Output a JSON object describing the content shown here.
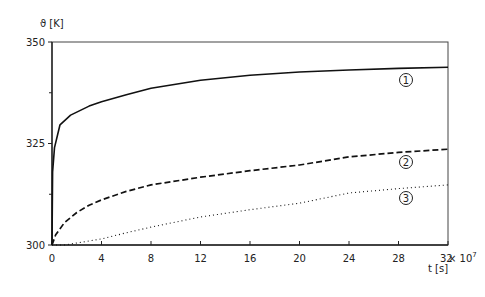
{
  "chart_data": {
    "type": "line",
    "title": "",
    "ylabel": "ϑ [K]",
    "xlabel": "t [s]",
    "x_multiplier": "× 10⁷",
    "xlim": [
      0,
      32
    ],
    "ylim": [
      300,
      350
    ],
    "x_ticks": [
      0,
      4,
      8,
      12,
      16,
      20,
      24,
      28,
      32
    ],
    "y_ticks": [
      300,
      325,
      350
    ],
    "y_minor_ticks": [
      312.5,
      337.5
    ],
    "grid": false,
    "legend": "inline circled numbers at right end of curves",
    "series": [
      {
        "name": "1",
        "style": "solid",
        "x": [
          0,
          0.05,
          0.2,
          0.65,
          1.5,
          3,
          4,
          6,
          8,
          12,
          16,
          20,
          24,
          28,
          32
        ],
        "y": [
          300,
          318,
          324,
          329.6,
          332,
          334.2,
          335.3,
          337,
          338.6,
          340.6,
          341.8,
          342.6,
          343.1,
          343.5,
          343.8
        ]
      },
      {
        "name": "2",
        "style": "dashed",
        "x": [
          0,
          0.3,
          1,
          2,
          3,
          4,
          6,
          8,
          12,
          16,
          20,
          24,
          28,
          32
        ],
        "y": [
          300,
          302.5,
          305.5,
          308,
          309.8,
          311.1,
          313.2,
          314.8,
          316.7,
          318.3,
          319.7,
          321.7,
          322.8,
          323.6
        ],
        "label": "2"
      },
      {
        "name": "3",
        "style": "dotted",
        "x": [
          0,
          1,
          2,
          4,
          6,
          8,
          12,
          16,
          20,
          24,
          28,
          32
        ],
        "y": [
          300,
          300,
          300.5,
          301.5,
          303,
          304.4,
          306.9,
          308.7,
          310.3,
          312.8,
          313.9,
          314.8
        ],
        "label": "3"
      }
    ]
  },
  "labels": {
    "y_axis": "ϑ [K]",
    "x_axis": "t [s]",
    "x_mult": "× 10",
    "x_mult_exp": "7",
    "curve1": "1",
    "curve2": "2",
    "curve3": "3"
  }
}
